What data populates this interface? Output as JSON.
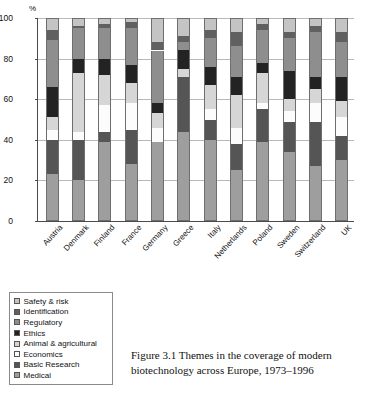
{
  "chart_data": {
    "type": "bar",
    "stacked": true,
    "normalized_percent": true,
    "title": "",
    "xlabel": "",
    "ylabel": "%",
    "ylim": [
      0,
      100
    ],
    "yticks": [
      0,
      20,
      40,
      60,
      80,
      100
    ],
    "grid": true,
    "legend_position": "below-left",
    "categories": [
      "Austria",
      "Denmark",
      "Finland",
      "France",
      "Germany",
      "Greece",
      "Italy",
      "Netherlands",
      "Poland",
      "Sweden",
      "Switzerland",
      "UK"
    ],
    "series": [
      {
        "name": "Medical",
        "color": "#9e9e9e",
        "values": [
          23,
          20,
          39,
          28,
          39,
          44,
          40,
          25,
          39,
          34,
          27,
          30
        ]
      },
      {
        "name": "Basic Research",
        "color": "#555555",
        "values": [
          17,
          20,
          5,
          17,
          0,
          27,
          10,
          13,
          16,
          15,
          22,
          12
        ]
      },
      {
        "name": "Economics",
        "color": "#fcfcfc",
        "values": [
          5,
          4,
          13,
          13,
          7,
          0,
          5,
          8,
          3,
          5,
          9,
          9
        ]
      },
      {
        "name": "Animal & agricultural",
        "color": "#d6d6d6",
        "values": [
          6,
          29,
          15,
          10,
          7,
          4,
          12,
          16,
          15,
          6,
          7,
          8
        ]
      },
      {
        "name": "Ethics",
        "color": "#232323",
        "values": [
          15,
          7,
          8,
          9,
          5,
          9,
          9,
          9,
          5,
          14,
          6,
          12
        ]
      },
      {
        "name": "Regulatory",
        "color": "#8e8e8e",
        "values": [
          23,
          15,
          15,
          18,
          26,
          4,
          14,
          15,
          16,
          16,
          22,
          17
        ]
      },
      {
        "name": "Identification",
        "color": "#606060",
        "values": [
          5,
          1,
          2,
          3,
          4,
          3,
          4,
          7,
          3,
          3,
          3,
          5
        ]
      },
      {
        "name": "Safety & risk",
        "color": "#c4c4c4",
        "values": [
          6,
          4,
          3,
          2,
          12,
          9,
          6,
          7,
          3,
          7,
          4,
          7
        ]
      }
    ],
    "legend_order_top_to_bottom": [
      "Safety & risk",
      "Identification",
      "Regulatory",
      "Ethics",
      "Animal & agricultural",
      "Economics",
      "Basic Research",
      "Medical"
    ]
  },
  "caption": {
    "line1": "Figure 3.1  Themes in the coverage of modern",
    "line2": "biotechnology across Europe, 1973–1996"
  }
}
